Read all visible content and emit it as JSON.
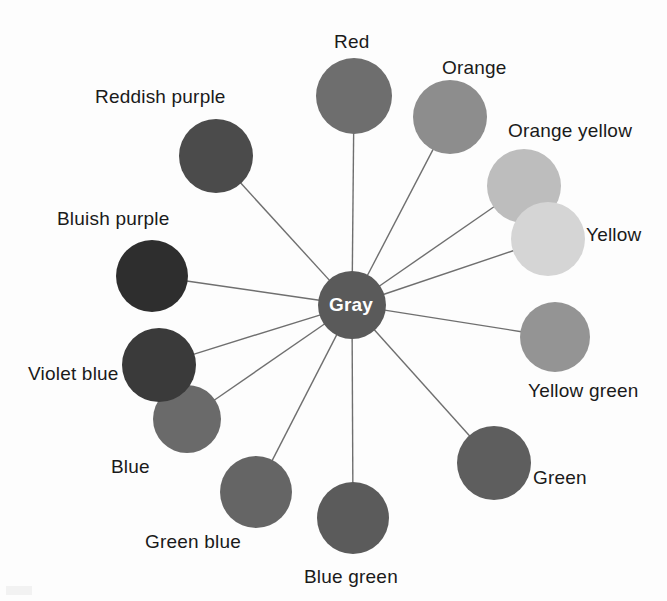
{
  "figure": {
    "type": "radial-diagram",
    "title": "",
    "background_color": "#fdfdfd",
    "spoke_color": "#6f6f6f",
    "center": {
      "label": "Gray",
      "cx": 352,
      "cy": 305,
      "r": 34,
      "fill": "#5a5a5a",
      "text_color": "#ffffff"
    },
    "nodes": [
      {
        "label": "Red",
        "cx": 354,
        "cy": 96,
        "r": 38,
        "fill": "#6e6e6e",
        "label_x": 334,
        "label_y": 32,
        "label_anchor": "start"
      },
      {
        "label": "Orange",
        "cx": 450,
        "cy": 117,
        "r": 37,
        "fill": "#8d8d8d",
        "label_x": 442,
        "label_y": 58,
        "label_anchor": "start"
      },
      {
        "label": "Orange yellow",
        "cx": 524,
        "cy": 186,
        "r": 37,
        "fill": "#bdbdbd",
        "label_x": 508,
        "label_y": 121,
        "label_anchor": "start"
      },
      {
        "label": "Yellow",
        "cx": 548,
        "cy": 239,
        "r": 37,
        "fill": "#d5d5d5",
        "label_x": 586,
        "label_y": 225,
        "label_anchor": "start"
      },
      {
        "label": "Yellow green",
        "cx": 555,
        "cy": 337,
        "r": 35,
        "fill": "#949494",
        "label_x": 528,
        "label_y": 381,
        "label_anchor": "start"
      },
      {
        "label": "Green",
        "cx": 494,
        "cy": 463,
        "r": 37,
        "fill": "#5e5e5e",
        "label_x": 533,
        "label_y": 468,
        "label_anchor": "start"
      },
      {
        "label": "Blue green",
        "cx": 353,
        "cy": 518,
        "r": 36,
        "fill": "#5b5b5b",
        "label_x": 304,
        "label_y": 567,
        "label_anchor": "start"
      },
      {
        "label": "Green blue",
        "cx": 256,
        "cy": 492,
        "r": 36,
        "fill": "#656565",
        "label_x": 145,
        "label_y": 532,
        "label_anchor": "start"
      },
      {
        "label": "Blue",
        "cx": 187,
        "cy": 419,
        "r": 34,
        "fill": "#6a6a6a",
        "label_x": 111,
        "label_y": 457,
        "label_anchor": "start"
      },
      {
        "label": "Violet blue",
        "cx": 159,
        "cy": 365,
        "r": 37,
        "fill": "#3a3a3a",
        "label_x": 28,
        "label_y": 364,
        "label_anchor": "start"
      },
      {
        "label": "Bluish purple",
        "cx": 152,
        "cy": 276,
        "r": 36,
        "fill": "#2e2e2e",
        "label_x": 57,
        "label_y": 209,
        "label_anchor": "start"
      },
      {
        "label": "Reddish purple",
        "cx": 216,
        "cy": 156,
        "r": 37,
        "fill": "#4b4b4b",
        "label_x": 95,
        "label_y": 87,
        "label_anchor": "start"
      }
    ]
  }
}
